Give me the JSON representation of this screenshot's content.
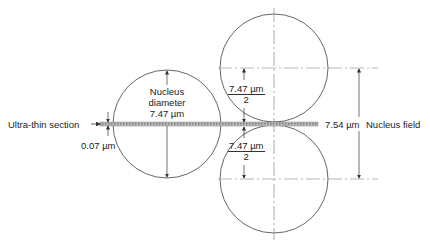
{
  "diagram": {
    "labels": {
      "ultra_thin_section": "Ultra-thin section",
      "section_thickness": "0.07 µm",
      "nucleus_diameter_line1": "Nucleus",
      "nucleus_diameter_line2": "diameter",
      "nucleus_diameter_value": "7.47 µm",
      "half_diameter_top_num": "7.47 µm",
      "half_diameter_top_den": "2",
      "half_diameter_bottom_num": "7.47 µm",
      "half_diameter_bottom_den": "2",
      "nucleus_field_value": "7.54 µm",
      "nucleus_field_label": "Nucleus field"
    },
    "colors": {
      "line": "#444444",
      "section_fill": "#9a9a9a",
      "centerline": "#888888"
    }
  }
}
